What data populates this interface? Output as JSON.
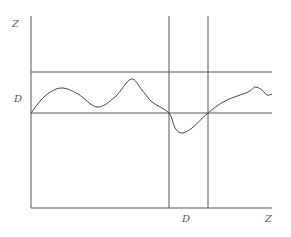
{
  "diagram": {
    "axes": {
      "y_label": "Z",
      "x_label": "Z"
    },
    "levels": {
      "left_label": "D",
      "bottom_label": "D"
    },
    "colors": {
      "line": "#555555",
      "curve": "#444444",
      "background": "#ffffff"
    },
    "geometry": {
      "y_axis_x": 31,
      "x_axis_y": 208,
      "axis_top_y": 16,
      "right_x": 272,
      "upper_hline_y": 72,
      "lower_hline_y": 113,
      "vline_1_x": 169,
      "vline_2_x": 208
    },
    "curve_points": [
      [
        31,
        113
      ],
      [
        45,
        96
      ],
      [
        61,
        88
      ],
      [
        78,
        94
      ],
      [
        97,
        107
      ],
      [
        115,
        97
      ],
      [
        131,
        79
      ],
      [
        142,
        90
      ],
      [
        152,
        102
      ],
      [
        169,
        113
      ],
      [
        175,
        128
      ],
      [
        182,
        133
      ],
      [
        192,
        128
      ],
      [
        208,
        113
      ],
      [
        225,
        101
      ],
      [
        248,
        92
      ],
      [
        255,
        87
      ],
      [
        262,
        90
      ],
      [
        267,
        95
      ],
      [
        272,
        94
      ]
    ]
  }
}
